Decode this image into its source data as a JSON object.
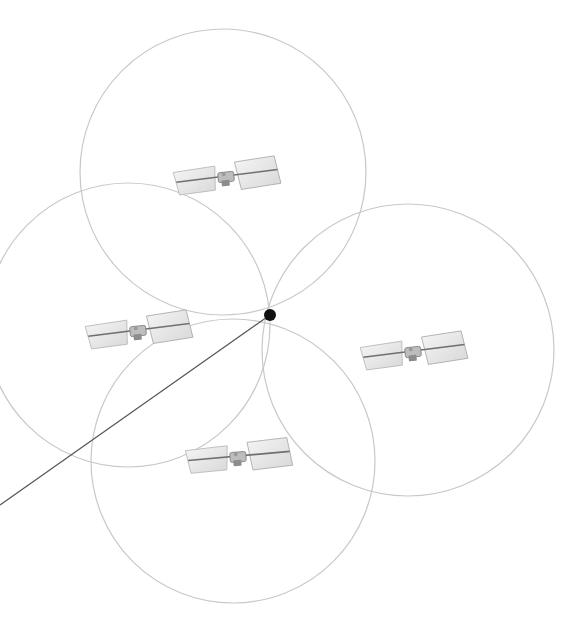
{
  "diagram": {
    "width": 580,
    "height": 628,
    "background": "#ffffff",
    "circle_stroke": "#c8c8c8",
    "line_stroke": "#555555",
    "point_color": "#111111",
    "receiver_point": {
      "x": 270,
      "y": 315,
      "r": 6
    },
    "signal_line": {
      "x1": 270,
      "y1": 315,
      "x2": 0,
      "y2": 505
    },
    "coverage_circles": [
      {
        "name": "coverage-circle-top",
        "cx": 223,
        "cy": 172,
        "r": 143
      },
      {
        "name": "coverage-circle-left",
        "cx": 128,
        "cy": 325,
        "r": 142
      },
      {
        "name": "coverage-circle-right",
        "cx": 408,
        "cy": 350,
        "r": 146
      },
      {
        "name": "coverage-circle-bottom",
        "cx": 233,
        "cy": 461,
        "r": 142
      }
    ],
    "satellites": [
      {
        "name": "satellite-top",
        "x": 226,
        "y": 177,
        "angle": -6
      },
      {
        "name": "satellite-left",
        "x": 138,
        "y": 331,
        "angle": -6
      },
      {
        "name": "satellite-right",
        "x": 413,
        "y": 352,
        "angle": -6
      },
      {
        "name": "satellite-bottom",
        "x": 238,
        "y": 457,
        "angle": -4
      }
    ]
  }
}
